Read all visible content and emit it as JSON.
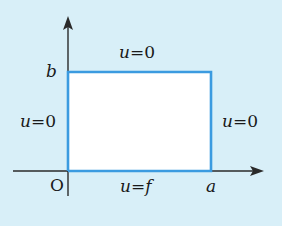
{
  "colors": {
    "background": "#d8eff8",
    "boundary": "#3b9be0",
    "axis": "#2a2a2a",
    "interior": "#ffffff"
  },
  "axes": {
    "origin_label": "O",
    "x_end_label": "a",
    "y_end_label": "b"
  },
  "boundary_conditions": {
    "top": {
      "var": "u",
      "eq": "=",
      "value": "0"
    },
    "left": {
      "var": "u",
      "eq": "=",
      "value": "0"
    },
    "right": {
      "var": "u",
      "eq": "=",
      "value": "0"
    },
    "bottom": {
      "var": "u",
      "eq": "=",
      "value": "f"
    }
  }
}
